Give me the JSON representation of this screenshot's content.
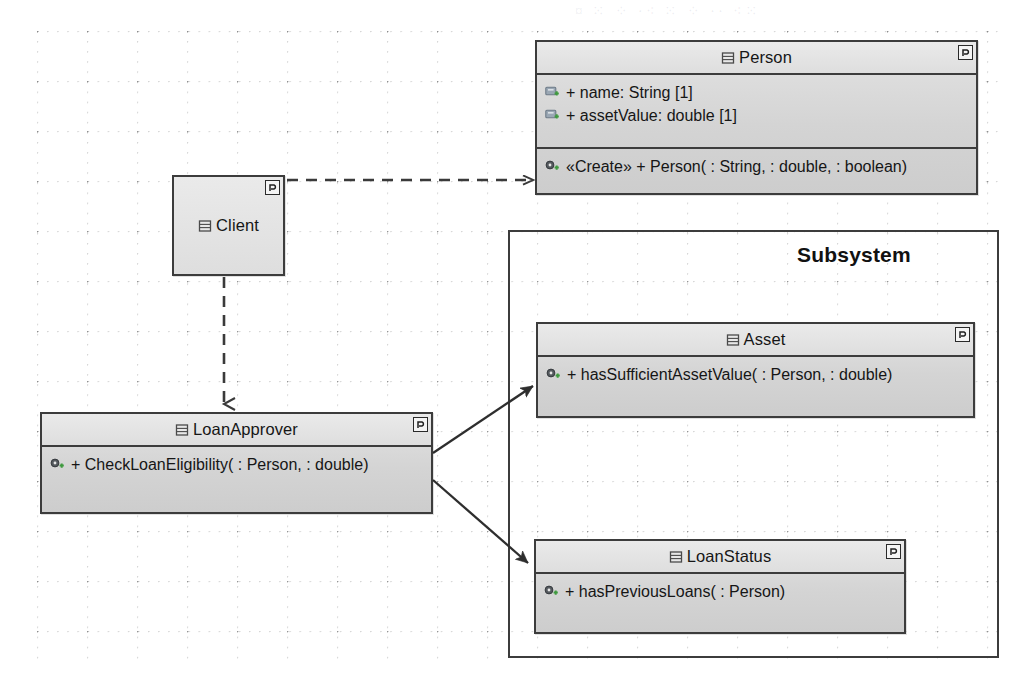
{
  "diagram": {
    "kind": "uml-class-diagram",
    "canvas": {
      "width": 1027,
      "height": 697
    },
    "background": {
      "style": "dotted-grid",
      "color": "#ffffff",
      "dot_color": "#787878"
    },
    "palette": {
      "class_fill": "#d6d6d6",
      "class_header_fill": "#e6e6e6",
      "border": "#3c3c3c",
      "text": "#161616",
      "attribute_icon": "#8a9aa8",
      "operation_icon": "#4a4a4a",
      "accent_plus": "#3f9a3f"
    }
  },
  "classes": {
    "person": {
      "name": "Person",
      "icon": "class-icon",
      "badge": "stereotype-badge-icon",
      "attributes": [
        {
          "icon": "attribute-icon",
          "text": "+ name: String [1]"
        },
        {
          "icon": "attribute-icon",
          "text": "+ assetValue: double [1]"
        }
      ],
      "operations": [
        {
          "icon": "operation-icon",
          "text": "«Create»  + Person( : String,  : double,  : boolean)"
        }
      ]
    },
    "client": {
      "name": "Client",
      "icon": "class-icon",
      "badge": "stereotype-badge-icon",
      "attributes": [],
      "operations": []
    },
    "loan_approver": {
      "name": "LoanApprover",
      "icon": "class-icon",
      "badge": "stereotype-badge-icon",
      "attributes": [],
      "operations": [
        {
          "icon": "operation-icon",
          "text": "+ CheckLoanEligibility( : Person,  : double)"
        }
      ]
    },
    "asset": {
      "name": "Asset",
      "icon": "class-icon",
      "badge": "stereotype-badge-icon",
      "attributes": [],
      "operations": [
        {
          "icon": "operation-icon",
          "text": "+ hasSufficientAssetValue( : Person,  : double)"
        }
      ]
    },
    "loan_status": {
      "name": "LoanStatus",
      "icon": "class-icon",
      "badge": "stereotype-badge-icon",
      "attributes": [],
      "operations": [
        {
          "icon": "operation-icon",
          "text": "+ hasPreviousLoans( : Person)"
        }
      ]
    }
  },
  "package": {
    "title": "Subsystem",
    "members": [
      "Asset",
      "LoanStatus"
    ]
  },
  "relationships": [
    {
      "name": "client-to-person-dependency",
      "from": "Client",
      "to": "Person",
      "style": "dashed",
      "arrow": "open"
    },
    {
      "name": "client-to-loanapprover-dependency",
      "from": "Client",
      "to": "LoanApprover",
      "style": "dashed",
      "arrow": "open"
    },
    {
      "name": "loanapprover-to-asset-association",
      "from": "LoanApprover",
      "to": "Asset",
      "style": "solid",
      "arrow": "filled"
    },
    {
      "name": "loanapprover-to-loanstatus-association",
      "from": "LoanApprover",
      "to": "LoanStatus",
      "style": "solid",
      "arrow": "filled"
    }
  ],
  "artifacts": {
    "top_bleed_text": "¤ ⁙ ⁘ ·⁖ ⁙ ⁘ ·· ⁖⁙"
  }
}
